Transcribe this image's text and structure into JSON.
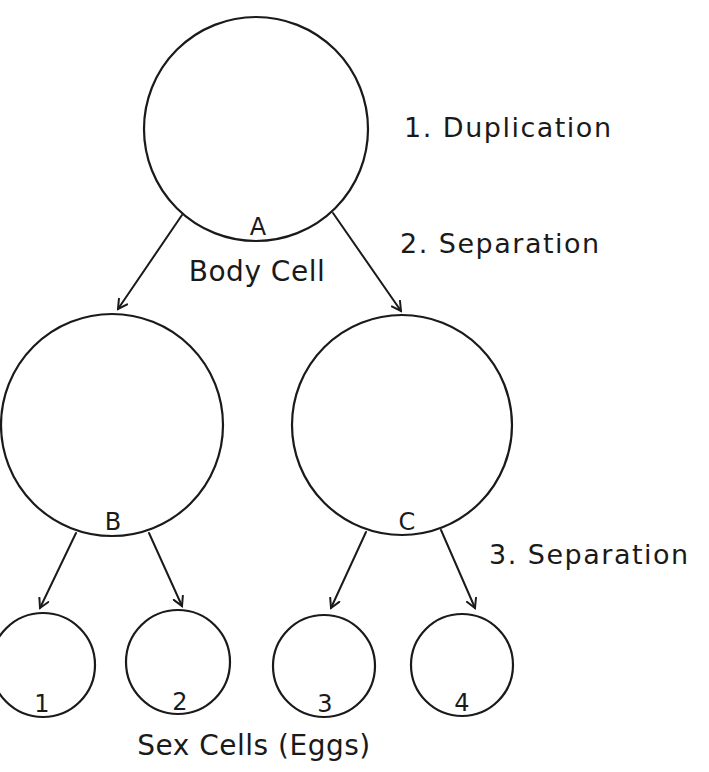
{
  "diagram": {
    "cells": {
      "a": {
        "letter": "A",
        "caption": "Body Cell"
      },
      "b": {
        "letter": "B"
      },
      "c": {
        "letter": "C"
      },
      "eggs": [
        {
          "letter": "1"
        },
        {
          "letter": "2"
        },
        {
          "letter": "3"
        },
        {
          "letter": "4"
        }
      ],
      "eggs_caption": "Sex Cells (Eggs)"
    },
    "steps": [
      {
        "label": "1. Duplication"
      },
      {
        "label": "2. Separation"
      },
      {
        "label": "3. Separation"
      }
    ],
    "stroke_color": "#1a1a1a",
    "background": "#ffffff"
  }
}
